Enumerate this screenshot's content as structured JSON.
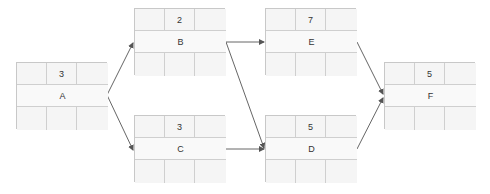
{
  "diagram": {
    "type": "activity-on-node network",
    "nodes": [
      {
        "id": "A",
        "label": "A",
        "duration": "3",
        "x": 16,
        "y": 62
      },
      {
        "id": "B",
        "label": "B",
        "duration": "2",
        "x": 134,
        "y": 8
      },
      {
        "id": "C",
        "label": "C",
        "duration": "3",
        "x": 134,
        "y": 115
      },
      {
        "id": "E",
        "label": "E",
        "duration": "7",
        "x": 265,
        "y": 8
      },
      {
        "id": "D",
        "label": "D",
        "duration": "5",
        "x": 265,
        "y": 115
      },
      {
        "id": "F",
        "label": "F",
        "duration": "5",
        "x": 384,
        "y": 62
      }
    ],
    "edges": [
      {
        "from": "A",
        "to": "B"
      },
      {
        "from": "A",
        "to": "C"
      },
      {
        "from": "B",
        "to": "E"
      },
      {
        "from": "B",
        "to": "D"
      },
      {
        "from": "C",
        "to": "D"
      },
      {
        "from": "E",
        "to": "F"
      },
      {
        "from": "D",
        "to": "F"
      }
    ],
    "colors": {
      "edge": "#555555",
      "border": "#c8c8c8",
      "fill": "#f5f5f5"
    }
  }
}
